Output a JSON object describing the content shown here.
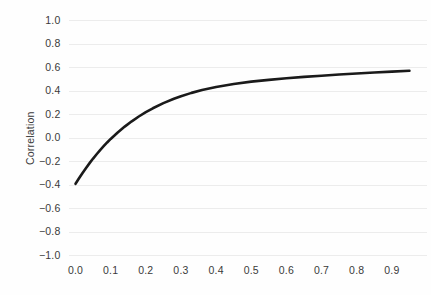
{
  "chart_data": {
    "type": "line",
    "title": "",
    "xlabel": "",
    "ylabel": "Correlation",
    "xlim": [
      -0.02,
      1.0
    ],
    "ylim": [
      -1.0,
      1.0
    ],
    "grid": true,
    "legend": false,
    "line_color": "#1a1a1a",
    "grid_color": "#ececec",
    "background_color": "#fefefe",
    "xticks": [
      "0.0",
      "0.1",
      "0.2",
      "0.3",
      "0.4",
      "0.5",
      "0.6",
      "0.7",
      "0.8",
      "0.9"
    ],
    "xtick_values": [
      0.0,
      0.1,
      0.2,
      0.3,
      0.4,
      0.5,
      0.6,
      0.7,
      0.8,
      0.9
    ],
    "yticks": [
      "1.0",
      "0.8",
      "0.6",
      "0.4",
      "0.2",
      "0.0",
      "−0.2",
      "−0.4",
      "−0.6",
      "−0.8",
      "−1.0"
    ],
    "ytick_values": [
      1.0,
      0.8,
      0.6,
      0.4,
      0.2,
      0.0,
      -0.2,
      -0.4,
      -0.6,
      -0.8,
      -1.0
    ],
    "series": [
      {
        "name": "Correlation",
        "x": [
          0.0,
          0.01,
          0.02,
          0.03,
          0.04,
          0.05,
          0.06,
          0.07,
          0.08,
          0.09,
          0.1,
          0.12,
          0.14,
          0.16,
          0.18,
          0.2,
          0.22,
          0.25,
          0.28,
          0.3,
          0.33,
          0.36,
          0.4,
          0.45,
          0.5,
          0.55,
          0.6,
          0.65,
          0.7,
          0.75,
          0.8,
          0.85,
          0.9,
          0.95
        ],
        "y": [
          -0.39,
          -0.343,
          -0.298,
          -0.255,
          -0.214,
          -0.175,
          -0.138,
          -0.103,
          -0.07,
          -0.038,
          -0.008,
          0.047,
          0.097,
          0.142,
          0.183,
          0.22,
          0.253,
          0.297,
          0.334,
          0.356,
          0.384,
          0.408,
          0.434,
          0.46,
          0.48,
          0.495,
          0.508,
          0.52,
          0.53,
          0.54,
          0.549,
          0.557,
          0.565,
          0.572
        ]
      }
    ]
  }
}
